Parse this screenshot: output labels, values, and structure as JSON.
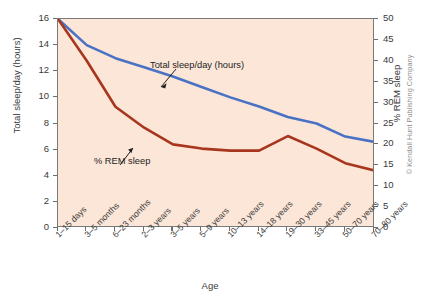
{
  "chart_data": {
    "type": "line",
    "title": "",
    "xlabel": "Age",
    "categories": [
      "1–15 days",
      "3–5 months",
      "6–23 months",
      "2–3 years",
      "3–5 years",
      "5–9 years",
      "10–13 years",
      "14–18 years",
      "19–30 years",
      "33–45 years",
      "50–70 years",
      "70–80 years"
    ],
    "grid": false,
    "legend_position": "inline-annotations",
    "axes": {
      "left": {
        "label": "Total sleep/day (hours)",
        "ylim": [
          0,
          16
        ],
        "ticks": [
          0,
          2,
          4,
          6,
          8,
          10,
          12,
          14,
          16
        ],
        "tick_labels": [
          "0",
          "2",
          "4",
          "6",
          "8",
          "10",
          "12",
          "14",
          "16"
        ]
      },
      "right": {
        "label": "% REM sleep",
        "ylim": [
          0,
          50
        ],
        "ticks": [
          0,
          5,
          10,
          15,
          20,
          25,
          30,
          35,
          40,
          45,
          50
        ],
        "tick_labels": [
          "0",
          "5",
          "10",
          "15",
          "20",
          "25",
          "30",
          "35",
          "40",
          "45",
          "50"
        ]
      }
    },
    "series": [
      {
        "name": "Total sleep/day (hours)",
        "axis": "left",
        "color": "#4a72c4",
        "unit": "hours",
        "values": [
          16.0,
          14.0,
          13.0,
          12.3,
          11.6,
          10.8,
          10.0,
          9.3,
          8.5,
          8.0,
          7.0,
          6.6
        ]
      },
      {
        "name": "% REM sleep",
        "axis": "right",
        "color": "#a8351e",
        "unit": "%",
        "values": [
          50.0,
          40.0,
          29.0,
          24.0,
          20.0,
          19.0,
          18.5,
          18.5,
          22.0,
          19.0,
          15.5,
          13.8
        ]
      }
    ],
    "annotations": [
      {
        "text": "Total sleep/day (hours)",
        "series": "Total sleep/day (hours)"
      },
      {
        "text": "% REM sleep",
        "series": "% REM sleep"
      }
    ]
  },
  "credit": {
    "text": "© Kendall Hunt Publishing Company"
  },
  "colors": {
    "plot_background": "#fbe6d8",
    "total_sleep_line": "#4a72c4",
    "rem_sleep_line": "#a8351e",
    "axis": "#6d6d6d",
    "text": "#3a3a3a"
  }
}
